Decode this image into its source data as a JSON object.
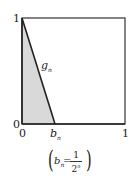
{
  "diagram": {
    "type": "function-graph",
    "axes": {
      "y_labels": [
        "1",
        "0"
      ],
      "x_labels": [
        "0",
        "b",
        "1"
      ],
      "x_label_subscript": "n"
    },
    "curve_label": {
      "main": "g",
      "sub": "n"
    },
    "formula": {
      "lhs": "b",
      "lhs_sub": "n",
      "equals": "=",
      "numerator": "1",
      "denominator_base": "2",
      "denominator_exp": "n"
    },
    "colors": {
      "shade": "#d9d9d9",
      "line": "#222222",
      "frame": "#333333"
    }
  }
}
